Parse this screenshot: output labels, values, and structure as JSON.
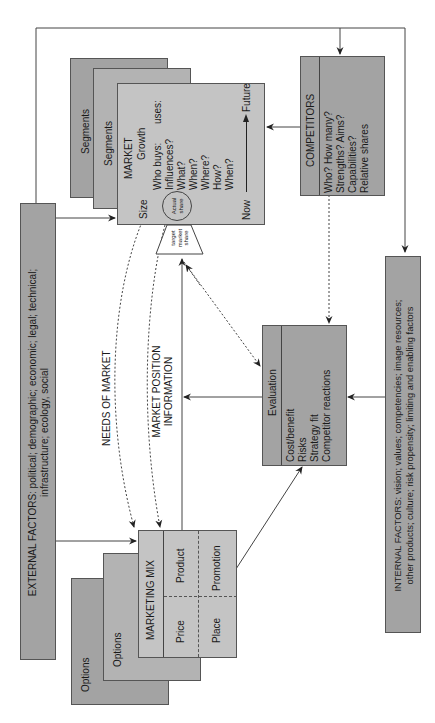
{
  "external_factors": {
    "line1": "EXTERNAL FACTORS: political; demographic; economic; legal; technical;",
    "line2": "infrastructure; ecology, social"
  },
  "internal_factors": {
    "line1": "INTERNAL FACTORS: vision; values; competencies; image resources;",
    "line2": "other products; culture; risk propensity; limiting and enabling factors"
  },
  "segments": {
    "back_label": "Segments",
    "mid_label": "Segments"
  },
  "market": {
    "title": "MARKET",
    "growth": "Growth",
    "who_buys": "Who buys:",
    "uses": "uses:",
    "questions": [
      "Influences?",
      "What?",
      "When?",
      "Where?",
      "How?",
      "When?"
    ],
    "size": "Size",
    "now": "Now",
    "future": "Future",
    "actual_share": [
      "Actual",
      "share"
    ],
    "target_share": [
      "target",
      "market",
      "share"
    ]
  },
  "competitors": {
    "title": "COMPETITORS",
    "items": [
      "Who? How many?",
      "Strengths? Aims?",
      "Capabilities?",
      "Relative shares"
    ]
  },
  "evaluation": {
    "title": "Evaluation",
    "items": [
      "Cost/benefit",
      "Risks",
      "Strategy fit",
      "Competitor reactions"
    ]
  },
  "flow_labels": {
    "needs_of_market": "NEEDS OF MARKET",
    "market_position_1": "MARKET POSITION",
    "market_position_2": "INFORMATION"
  },
  "marketing_mix": {
    "title": "MARKETING MIX",
    "product": "Product",
    "price": "Price",
    "promotion": "Promotion",
    "place": "Place"
  },
  "options": {
    "back_label": "Options",
    "mid_label": "Options"
  },
  "colors": {
    "dark_box": "#a3a3a3",
    "mid_box": "#b3b3b3",
    "light_box": "#c4c4c4",
    "line": "#444444"
  }
}
